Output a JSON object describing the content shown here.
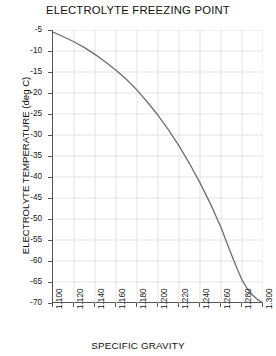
{
  "chart_data": {
    "type": "line",
    "title": "ELECTROLYTE FREEZING POINT",
    "xlabel": "SPECIFIC GRAVITY",
    "ylabel": "ELECTROLYTE TEMPERATURE (deg C)",
    "xlim": [
      1.1,
      1.3
    ],
    "ylim": [
      -70,
      -5
    ],
    "grid": true,
    "legend": "none",
    "xticks": [
      1.1,
      1.12,
      1.14,
      1.16,
      1.18,
      1.2,
      1.22,
      1.24,
      1.26,
      1.28,
      1.3
    ],
    "xticklabels": [
      "1.100",
      "1.120",
      "1.140",
      "1.160",
      "1.180",
      "1.200",
      "1.220",
      "1.240",
      "1.260",
      "1.280",
      "1.300"
    ],
    "yticks": [
      -5,
      -10,
      -15,
      -20,
      -25,
      -30,
      -35,
      -40,
      -45,
      -50,
      -55,
      -60,
      -65,
      -70
    ],
    "yticklabels": [
      "-5",
      "-10",
      "-15",
      "-20",
      "-25",
      "-30",
      "-35",
      "-40",
      "-45",
      "-50",
      "-55",
      "-60",
      "-65",
      "-70"
    ],
    "line_color": "#6e6e6e",
    "grid_color": "#dcdcdc",
    "axis_color": "#555555",
    "series": [
      {
        "name": "freezing point",
        "x": [
          1.1,
          1.11,
          1.12,
          1.13,
          1.14,
          1.15,
          1.16,
          1.17,
          1.18,
          1.19,
          1.2,
          1.21,
          1.22,
          1.23,
          1.24,
          1.25,
          1.26,
          1.27,
          1.275,
          1.28,
          1.285,
          1.29,
          1.295,
          1.3
        ],
        "y": [
          -5.5,
          -6.6,
          -7.8,
          -9.2,
          -10.8,
          -12.6,
          -14.6,
          -16.8,
          -19.3,
          -22.2,
          -25.3,
          -28.8,
          -32.6,
          -36.8,
          -41.4,
          -46.4,
          -52.0,
          -58.5,
          -61.6,
          -64.5,
          -66.6,
          -68.1,
          -69.2,
          -70.0
        ]
      }
    ]
  }
}
